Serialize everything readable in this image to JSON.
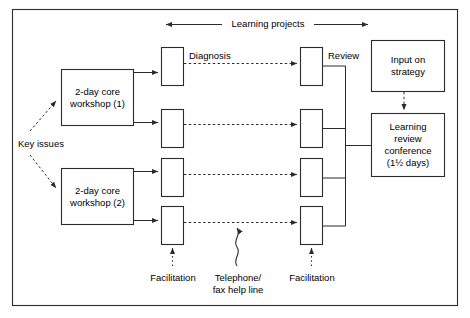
{
  "diagram": {
    "title_flow": "Learning projects",
    "frame": {
      "x": 12,
      "y": 9,
      "w": 446,
      "h": 297
    },
    "boxes": [
      {
        "id": "workshop1",
        "label": "2-day core\nworkshop (1)",
        "x": 61,
        "y": 69,
        "w": 73,
        "h": 57
      },
      {
        "id": "workshop2",
        "label": "2-day core\nworkshop (2)",
        "x": 61,
        "y": 168,
        "w": 73,
        "h": 57
      },
      {
        "id": "diagnosis1",
        "label": "",
        "x": 161,
        "y": 47,
        "w": 23,
        "h": 39
      },
      {
        "id": "diagnosis2",
        "label": "",
        "x": 161,
        "y": 109,
        "w": 23,
        "h": 39
      },
      {
        "id": "diagnosis3",
        "label": "",
        "x": 161,
        "y": 158,
        "w": 23,
        "h": 39
      },
      {
        "id": "diagnosis4",
        "label": "",
        "x": 161,
        "y": 206,
        "w": 23,
        "h": 39
      },
      {
        "id": "review1",
        "label": "",
        "x": 300,
        "y": 47,
        "w": 23,
        "h": 39
      },
      {
        "id": "review2",
        "label": "",
        "x": 300,
        "y": 109,
        "w": 23,
        "h": 39
      },
      {
        "id": "review3",
        "label": "",
        "x": 300,
        "y": 158,
        "w": 23,
        "h": 39
      },
      {
        "id": "review4",
        "label": "",
        "x": 300,
        "y": 206,
        "w": 23,
        "h": 39
      },
      {
        "id": "input-strategy",
        "label": "Input on\nstrategy",
        "x": 371,
        "y": 40,
        "w": 74,
        "h": 52
      },
      {
        "id": "learning-review-conference",
        "label": "Learning\nreview\nconference\n(1½ days)",
        "x": 371,
        "y": 113,
        "w": 74,
        "h": 64
      }
    ],
    "labels": [
      {
        "id": "diagnosis-label",
        "text": "Diagnosis",
        "x": 189,
        "y": 47
      },
      {
        "id": "review-label",
        "text": "Review",
        "x": 328,
        "y": 47
      },
      {
        "id": "key-issues-label",
        "text": "Key issues",
        "x": 18,
        "y": 140
      },
      {
        "id": "facilitation-left-label",
        "text": "Facilitation",
        "x": 148,
        "y": 273
      },
      {
        "id": "telephone-fax-label",
        "text": "Telephone/\nfax help line",
        "x": 208,
        "y": 273
      },
      {
        "id": "facilitation-right-label",
        "text": "Facilitation",
        "x": 287,
        "y": 273
      }
    ],
    "colors": {
      "stroke": "#2b2b2b",
      "background": "#ffffff",
      "text": "#000000"
    }
  }
}
